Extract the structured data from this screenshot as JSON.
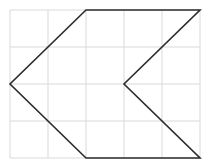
{
  "figure": {
    "grid": {
      "columns": 5,
      "rows": 4,
      "origin": [
        10,
        10
      ],
      "cell_width": 38,
      "cell_height": 37,
      "line_color": "#d9d9d9"
    },
    "shape": {
      "stroke_color": "#2b2b2b",
      "stroke_width": 1.6,
      "vertices_grid_units": [
        [
          2,
          0
        ],
        [
          5,
          0
        ],
        [
          3,
          2
        ],
        [
          5,
          4
        ],
        [
          2,
          4
        ],
        [
          0,
          2
        ]
      ]
    }
  }
}
